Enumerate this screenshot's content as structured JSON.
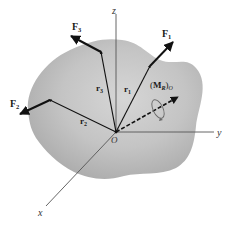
{
  "figure": {
    "type": "3D force system on rigid body",
    "axes": {
      "x": "x",
      "y": "y",
      "z": "z",
      "origin": "O"
    },
    "forces": [
      {
        "name": "F",
        "sub": "1",
        "position_vector": {
          "name": "r",
          "sub": "1"
        }
      },
      {
        "name": "F",
        "sub": "2",
        "position_vector": {
          "name": "r",
          "sub": "2"
        }
      },
      {
        "name": "F",
        "sub": "3",
        "position_vector": {
          "name": "r",
          "sub": "3"
        }
      }
    ],
    "resultant_moment": {
      "open": "(",
      "name": "M",
      "sub": "R",
      "close": ")",
      "point": "O"
    }
  },
  "colors": {
    "body_light": "#d9d9d9",
    "body_dark": "#a8a8a8",
    "vector": "#111111",
    "axis": "#555555",
    "background": "#ffffff"
  }
}
